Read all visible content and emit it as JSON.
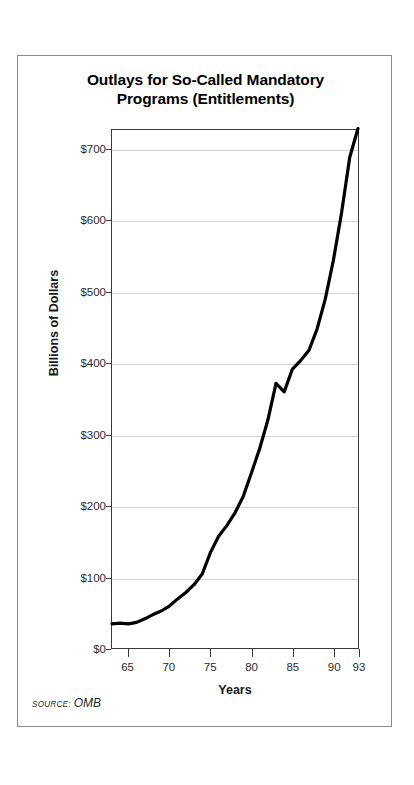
{
  "chart_title": {
    "line1": "Outlays for So-Called Mandatory",
    "line2": "Programs (Entitlements)"
  },
  "axis": {
    "y_title": "Billions of Dollars",
    "x_title": "Years"
  },
  "source": {
    "kicker": "SOURCE:",
    "value": "OMB"
  },
  "colors": {
    "line": "#000000",
    "grid": "#d0d0d0",
    "axis": "#3a3a3a",
    "frame": "#8b8b8b",
    "text": "#1a1a1a"
  },
  "chart_data": {
    "type": "line",
    "title": "Outlays for So-Called Mandatory Programs (Entitlements)",
    "xlabel": "Years",
    "ylabel": "Billions of Dollars",
    "xlim": [
      1963,
      1993
    ],
    "ylim": [
      0,
      730
    ],
    "grid": true,
    "legend": false,
    "source": "SOURCE: OMB",
    "y_ticks": [
      0,
      100,
      200,
      300,
      400,
      500,
      600,
      700
    ],
    "y_tick_labels": [
      "$0",
      "$100",
      "$200",
      "$300",
      "$400",
      "$500",
      "$600",
      "$700"
    ],
    "x_ticks": [
      1965,
      1970,
      1975,
      1980,
      1985,
      1990,
      1993
    ],
    "x_tick_labels": [
      "65",
      "70",
      "75",
      "80",
      "85",
      "90",
      "93"
    ],
    "series": [
      {
        "name": "Mandatory program outlays",
        "x": [
          1963,
          1964,
          1965,
          1966,
          1967,
          1968,
          1969,
          1970,
          1971,
          1972,
          1973,
          1974,
          1975,
          1976,
          1977,
          1978,
          1979,
          1980,
          1981,
          1982,
          1983,
          1984,
          1985,
          1986,
          1987,
          1988,
          1989,
          1990,
          1991,
          1992,
          1993
        ],
        "values": [
          34,
          35,
          34,
          36,
          41,
          47,
          52,
          59,
          69,
          78,
          89,
          104,
          134,
          157,
          172,
          190,
          213,
          246,
          280,
          320,
          372,
          360,
          392,
          404,
          418,
          448,
          490,
          545,
          612,
          690,
          730
        ]
      }
    ]
  }
}
